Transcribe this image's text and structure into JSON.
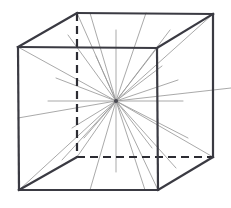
{
  "figure": {
    "type": "line-diagram",
    "canvas": {
      "width": 231,
      "height": 208,
      "background": "#ffffff"
    },
    "colors": {
      "edge_solid": "#3a3a42",
      "edge_hidden": "#2c2c33",
      "ray": "#9a9a9a",
      "center_dot": "#4a4a52"
    },
    "vertices": {
      "front_top_left": {
        "label": "front-top-left",
        "x": 18,
        "y": 47
      },
      "front_top_right": {
        "label": "front-top-right",
        "x": 157,
        "y": 48
      },
      "front_bottom_left": {
        "label": "front-bottom-left",
        "x": 19,
        "y": 190
      },
      "front_bottom_right": {
        "label": "front-bottom-right",
        "x": 158,
        "y": 190
      },
      "back_top_left": {
        "label": "back-top-left",
        "x": 77,
        "y": 13
      },
      "back_top_right": {
        "label": "back-top-right",
        "x": 213,
        "y": 14
      },
      "back_bottom_left": {
        "label": "back-bottom-left",
        "x": 77,
        "y": 157
      },
      "back_bottom_right": {
        "label": "back-bottom-right",
        "x": 213,
        "y": 157
      }
    },
    "center_point": {
      "label": "convergence-point",
      "x": 116,
      "y": 101
    },
    "solid_edges": [
      {
        "name": "front-top",
        "x1": 18,
        "y1": 47,
        "x2": 157,
        "y2": 48
      },
      {
        "name": "front-right",
        "x1": 157,
        "y1": 48,
        "x2": 158,
        "y2": 190
      },
      {
        "name": "front-bottom",
        "x1": 158,
        "y1": 190,
        "x2": 19,
        "y2": 190
      },
      {
        "name": "front-left",
        "x1": 19,
        "y1": 190,
        "x2": 18,
        "y2": 47
      },
      {
        "name": "back-top",
        "x1": 77,
        "y1": 13,
        "x2": 213,
        "y2": 14
      },
      {
        "name": "back-right",
        "x1": 213,
        "y1": 14,
        "x2": 213,
        "y2": 157
      },
      {
        "name": "top-left-diagonal",
        "x1": 18,
        "y1": 47,
        "x2": 77,
        "y2": 13
      },
      {
        "name": "top-right-diagonal",
        "x1": 157,
        "y1": 48,
        "x2": 213,
        "y2": 14
      },
      {
        "name": "bottom-right-diagonal",
        "x1": 158,
        "y1": 190,
        "x2": 213,
        "y2": 157
      },
      {
        "name": "bottom-left-diagonal",
        "x1": 19,
        "y1": 190,
        "x2": 77,
        "y2": 157
      }
    ],
    "hidden_edges": [
      {
        "name": "back-left-vertical",
        "x1": 77,
        "y1": 13,
        "x2": 77,
        "y2": 157
      },
      {
        "name": "back-bottom-horizontal",
        "x1": 77,
        "y1": 157,
        "x2": 213,
        "y2": 157
      }
    ],
    "rays": [
      {
        "name": "ray-to-front-top-left",
        "x2": 18,
        "y2": 47
      },
      {
        "name": "ray-to-front-top-right",
        "x2": 157,
        "y2": 48
      },
      {
        "name": "ray-to-front-bottom-left",
        "x2": 19,
        "y2": 190
      },
      {
        "name": "ray-to-front-bottom-right",
        "x2": 158,
        "y2": 190
      },
      {
        "name": "ray-to-back-top-left",
        "x2": 77,
        "y2": 13
      },
      {
        "name": "ray-to-back-top-right",
        "x2": 213,
        "y2": 14
      },
      {
        "name": "ray-to-back-bottom-left",
        "x2": 77,
        "y2": 157
      },
      {
        "name": "ray-to-back-bottom-right",
        "x2": 213,
        "y2": 157
      },
      {
        "name": "ray-up-vertical",
        "x2": 116,
        "y2": 30
      },
      {
        "name": "ray-down-vertical",
        "x2": 116,
        "y2": 172
      },
      {
        "name": "ray-left-horizontal",
        "x2": 48,
        "y2": 101
      },
      {
        "name": "ray-right-horizontal",
        "x2": 183,
        "y2": 101
      },
      {
        "name": "ray-left-far-lower",
        "x2": 18,
        "y2": 118
      },
      {
        "name": "ray-right-far-upper",
        "x2": 231,
        "y2": 88
      },
      {
        "name": "ray-upper-mid-left",
        "x2": 90,
        "y2": 13
      },
      {
        "name": "ray-upper-mid-right",
        "x2": 146,
        "y2": 13
      },
      {
        "name": "ray-lower-mid-left",
        "x2": 90,
        "y2": 190
      },
      {
        "name": "ray-lower-mid-right",
        "x2": 145,
        "y2": 190
      },
      {
        "name": "ray-upper-left-steep",
        "x2": 68,
        "y2": 35
      },
      {
        "name": "ray-upper-right-steep",
        "x2": 170,
        "y2": 30
      },
      {
        "name": "ray-lower-left-steep",
        "x2": 62,
        "y2": 160
      },
      {
        "name": "ray-lower-right-steep",
        "x2": 176,
        "y2": 168
      },
      {
        "name": "ray-mid-left-upper",
        "x2": 56,
        "y2": 78
      },
      {
        "name": "ray-mid-right-upper",
        "x2": 178,
        "y2": 80
      },
      {
        "name": "ray-mid-left-lower",
        "x2": 72,
        "y2": 128
      },
      {
        "name": "ray-mid-right-lower",
        "x2": 188,
        "y2": 138
      },
      {
        "name": "ray-short-upper-right-a",
        "x2": 162,
        "y2": 66
      },
      {
        "name": "ray-short-lower-right-a",
        "x2": 152,
        "y2": 148
      },
      {
        "name": "ray-short-upper-left-a",
        "x2": 96,
        "y2": 56
      },
      {
        "name": "ray-short-lower-left-a",
        "x2": 84,
        "y2": 138
      }
    ]
  }
}
